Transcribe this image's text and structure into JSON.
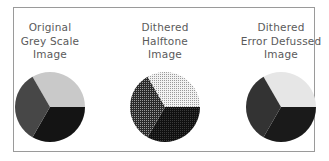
{
  "figure": {
    "panels": [
      {
        "id": "original",
        "caption_lines": [
          "Original",
          "Grey Scale",
          "Image"
        ],
        "render": "solid",
        "slices": [
          {
            "name": "light",
            "start_deg": -30,
            "end_deg": 90,
            "color": "#c9c9c9"
          },
          {
            "name": "black",
            "start_deg": 90,
            "end_deg": 210,
            "color": "#141414"
          },
          {
            "name": "dark-grey",
            "start_deg": 210,
            "end_deg": 330,
            "color": "#474747"
          }
        ]
      },
      {
        "id": "halftone",
        "caption_lines": [
          "Dithered",
          "Halftone",
          "Image"
        ],
        "render": "halftone",
        "slices": [
          {
            "name": "light",
            "start_deg": -30,
            "end_deg": 90,
            "color": "#c9c9c9"
          },
          {
            "name": "black",
            "start_deg": 90,
            "end_deg": 210,
            "color": "#141414"
          },
          {
            "name": "dark-grey",
            "start_deg": 210,
            "end_deg": 330,
            "color": "#474747"
          }
        ]
      },
      {
        "id": "error-diffused",
        "caption_lines": [
          "Dithered",
          "Error Defussed",
          "Image"
        ],
        "render": "diffused",
        "slices": [
          {
            "name": "light",
            "start_deg": -30,
            "end_deg": 90,
            "color": "#e6e6e6"
          },
          {
            "name": "black",
            "start_deg": 90,
            "end_deg": 210,
            "color": "#1a1a1a"
          },
          {
            "name": "dark-grey",
            "start_deg": 210,
            "end_deg": 330,
            "color": "#333333"
          }
        ]
      }
    ]
  },
  "chart_data": [
    {
      "type": "pie",
      "title": "Original Grey Scale Image",
      "categories": [
        "Light grey",
        "Black",
        "Dark grey"
      ],
      "values": [
        33.3,
        33.3,
        33.3
      ]
    },
    {
      "type": "pie",
      "title": "Dithered Halftone Image",
      "categories": [
        "Light grey",
        "Black",
        "Dark grey"
      ],
      "values": [
        33.3,
        33.3,
        33.3
      ]
    },
    {
      "type": "pie",
      "title": "Dithered Error Defussed Image",
      "categories": [
        "Light grey",
        "Black",
        "Dark grey"
      ],
      "values": [
        33.3,
        33.3,
        33.3
      ]
    }
  ]
}
